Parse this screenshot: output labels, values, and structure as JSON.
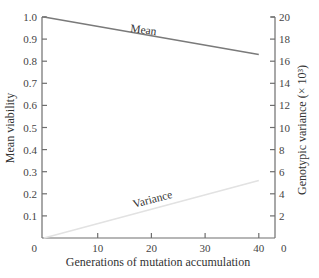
{
  "chart_data": {
    "type": "line",
    "title": "",
    "xlabel": "Generations of mutation accumulation",
    "ylabel": "Mean viability",
    "ylabel_right": "Genotypic variance (× 10³)",
    "x_ticks": [
      "0",
      "10",
      "20",
      "30",
      "40"
    ],
    "x_tick_values": [
      0,
      10,
      20,
      30,
      40
    ],
    "xlim": [
      0,
      43
    ],
    "y_ticks": [
      "0.1",
      "0.2",
      "0.3",
      "0.4",
      "0.5",
      "0.6",
      "0.7",
      "0.8",
      "0.9",
      "1.0"
    ],
    "y_tick_values": [
      0.1,
      0.2,
      0.3,
      0.4,
      0.5,
      0.6,
      0.7,
      0.8,
      0.9,
      1.0
    ],
    "ylim": [
      0,
      1.0
    ],
    "y2_ticks": [
      "0",
      "2",
      "4",
      "6",
      "8",
      "10",
      "12",
      "14",
      "16",
      "18",
      "20"
    ],
    "y2_tick_values": [
      0,
      2,
      4,
      6,
      8,
      10,
      12,
      14,
      16,
      18,
      20
    ],
    "y2lim": [
      0,
      20
    ],
    "grid": false,
    "legend": "inline labels",
    "series": [
      {
        "name": "Mean",
        "axis": "left",
        "color": "#7a7a7a",
        "x": [
          0,
          40
        ],
        "values": [
          1.0,
          0.83
        ]
      },
      {
        "name": "Variance",
        "axis": "right",
        "color": "#e2e2e2",
        "x": [
          0,
          40
        ],
        "values": [
          0.0,
          5.2
        ]
      }
    ]
  },
  "labels": {
    "mean": "Mean",
    "variance": "Variance",
    "origin_left": "0",
    "origin_right": "0"
  }
}
